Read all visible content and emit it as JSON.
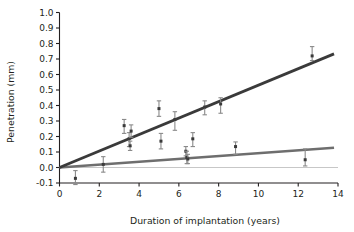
{
  "chart_data": {
    "type": "scatter",
    "title": "",
    "subtitle": "",
    "xlabel": "Duration of implantation (years)",
    "ylabel": "Penetration (mm)",
    "xlim": [
      0,
      14
    ],
    "ylim": [
      -0.1,
      1.0
    ],
    "xticks": [
      0,
      2,
      4,
      6,
      8,
      10,
      12,
      14
    ],
    "xtick_labels": [
      "0",
      "2",
      "4",
      "6",
      "8",
      "10",
      "12",
      "14"
    ],
    "yticks": [
      -0.1,
      0.0,
      0.1,
      0.2,
      0.3,
      0.4,
      0.5,
      0.6,
      0.7,
      0.8,
      0.9,
      1.0
    ],
    "ytick_labels": [
      "-0.1",
      "0.0",
      "0.1",
      "0.2",
      "0.3",
      "0.4",
      "0.5",
      "0.6",
      "0.7",
      "0.8",
      "0.9",
      "1.0"
    ],
    "grid": false,
    "legend": "none",
    "colors": {
      "upper_fit_line": "#3a3a3a",
      "lower_fit_line": "#6e6e6e",
      "marker": "#3a3a3a",
      "error_bar": "#8a8a8a",
      "axis": "#231f20",
      "background": "#ffffff"
    },
    "series": [
      {
        "name": "Upper regression line",
        "type": "line",
        "color": "#3a3a3a",
        "x": [
          0,
          13.8
        ],
        "y": [
          0.0,
          0.733
        ]
      },
      {
        "name": "Lower regression line",
        "type": "line",
        "color": "#6e6e6e",
        "x": [
          0,
          13.8
        ],
        "y": [
          0.0,
          0.127
        ]
      },
      {
        "name": "Penetration measurements",
        "type": "scatter",
        "color": "#3a3a3a",
        "points": [
          {
            "x": 0.8,
            "y": -0.07,
            "yerr_low": 0.04,
            "yerr_high": 0.05
          },
          {
            "x": 2.2,
            "y": 0.02,
            "yerr_low": 0.05,
            "yerr_high": 0.05
          },
          {
            "x": 3.25,
            "y": 0.27,
            "yerr_low": 0.05,
            "yerr_high": 0.04
          },
          {
            "x": 3.5,
            "y": 0.185,
            "yerr_low": 0.05,
            "yerr_high": 0.04
          },
          {
            "x": 3.6,
            "y": 0.235,
            "yerr_low": 0.04,
            "yerr_high": 0.04
          },
          {
            "x": 3.55,
            "y": 0.14,
            "yerr_low": 0.03,
            "yerr_high": 0.03
          },
          {
            "x": 5.0,
            "y": 0.38,
            "yerr_low": 0.05,
            "yerr_high": 0.05
          },
          {
            "x": 5.1,
            "y": 0.17,
            "yerr_low": 0.05,
            "yerr_high": 0.05
          },
          {
            "x": 5.8,
            "y": 0.31,
            "yerr_low": 0.07,
            "yerr_high": 0.05
          },
          {
            "x": 6.35,
            "y": 0.105,
            "yerr_low": 0.03,
            "yerr_high": 0.03
          },
          {
            "x": 6.4,
            "y": 0.065,
            "yerr_low": 0.04,
            "yerr_high": 0.04
          },
          {
            "x": 6.45,
            "y": 0.055,
            "yerr_low": 0.03,
            "yerr_high": 0.03
          },
          {
            "x": 6.7,
            "y": 0.185,
            "yerr_low": 0.05,
            "yerr_high": 0.04
          },
          {
            "x": 7.3,
            "y": 0.39,
            "yerr_low": 0.05,
            "yerr_high": 0.04
          },
          {
            "x": 8.1,
            "y": 0.41,
            "yerr_low": 0.06,
            "yerr_high": 0.04
          },
          {
            "x": 8.85,
            "y": 0.135,
            "yerr_low": 0.05,
            "yerr_high": 0.03
          },
          {
            "x": 12.35,
            "y": 0.05,
            "yerr_low": 0.04,
            "yerr_high": 0.07
          },
          {
            "x": 12.7,
            "y": 0.72,
            "yerr_low": 0.03,
            "yerr_high": 0.06
          }
        ]
      }
    ]
  }
}
